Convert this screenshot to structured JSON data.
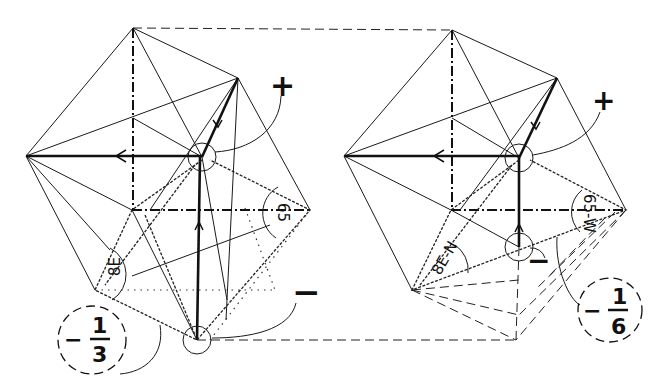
{
  "figures": [
    {
      "id": "left",
      "plus_label": "+",
      "minus_label": "−",
      "fraction": {
        "sign": "−",
        "numerator": "1",
        "denominator": "3"
      },
      "edge_labels": [
        "8E",
        "65"
      ]
    },
    {
      "id": "right",
      "plus_label": "+",
      "minus_label": "−",
      "fraction": {
        "sign": "−",
        "numerator": "1",
        "denominator": "6"
      },
      "edge_labels": [
        "8E-N",
        "65-W"
      ]
    }
  ]
}
